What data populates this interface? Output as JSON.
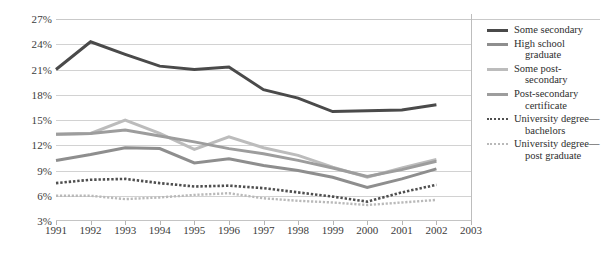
{
  "axes": {
    "y_ticks": [
      "27%",
      "24%",
      "21%",
      "18%",
      "15%",
      "12%",
      "9%",
      "6%",
      "3%"
    ],
    "x_ticks": [
      "1991",
      "1992",
      "1993",
      "1994",
      "1995",
      "1996",
      "1997",
      "1998",
      "1999",
      "2000",
      "2001",
      "2002",
      "2003"
    ]
  },
  "legend": {
    "items": [
      {
        "label_line1": "Some secondary",
        "label_line2": "",
        "color": "#4a4a4a",
        "style": "solid",
        "width": 3.0
      },
      {
        "label_line1": "High school",
        "label_line2": "graduate",
        "color": "#8e8e8e",
        "style": "solid",
        "width": 3.0
      },
      {
        "label_line1": "Some post-",
        "label_line2": "secondary",
        "color": "#bcbcbc",
        "style": "solid",
        "width": 3.0
      },
      {
        "label_line1": "Post-secondary",
        "label_line2": "certificate",
        "color": "#9d9d9d",
        "style": "solid",
        "width": 3.0
      },
      {
        "label_line1": "University degree—",
        "label_line2": "bachelors",
        "color": "#4f4f4f",
        "style": "dotted",
        "width": 2.6
      },
      {
        "label_line1": "University degree—",
        "label_line2": "post graduate",
        "color": "#b9b9b9",
        "style": "dotted",
        "width": 2.4
      }
    ]
  },
  "chart_data": {
    "type": "line",
    "title": "",
    "xlabel": "",
    "ylabel": "",
    "x": [
      "1991",
      "1992",
      "1993",
      "1994",
      "1995",
      "1996",
      "1997",
      "1998",
      "1999",
      "2000",
      "2001",
      "2002"
    ],
    "xlim": [
      "1991",
      "2003"
    ],
    "ylim": [
      3,
      27
    ],
    "ytick_step": 3,
    "grid": true,
    "legend_position": "right",
    "series": [
      {
        "name": "Some secondary",
        "color": "#4a4a4a",
        "style": "solid",
        "width": 3.0,
        "values": [
          21.0,
          24.3,
          22.8,
          21.4,
          21.0,
          21.3,
          18.6,
          17.6,
          16.0,
          16.1,
          16.2,
          16.8
        ]
      },
      {
        "name": "High school graduate",
        "color": "#8e8e8e",
        "style": "solid",
        "width": 3.0,
        "values": [
          10.2,
          10.9,
          11.7,
          11.6,
          9.9,
          10.4,
          9.6,
          9.0,
          8.2,
          7.0,
          8.0,
          9.2
        ]
      },
      {
        "name": "Some post-secondary",
        "color": "#bcbcbc",
        "style": "solid",
        "width": 3.0,
        "values": [
          13.3,
          13.4,
          15.0,
          13.4,
          11.5,
          13.0,
          11.7,
          10.8,
          9.4,
          8.2,
          9.3,
          10.3
        ]
      },
      {
        "name": "Post-secondary certificate",
        "color": "#9d9d9d",
        "style": "solid",
        "width": 3.0,
        "values": [
          13.3,
          13.4,
          13.8,
          13.1,
          12.4,
          11.6,
          11.0,
          10.2,
          9.3,
          8.3,
          9.1,
          10.1
        ]
      },
      {
        "name": "University degree—bachelors",
        "color": "#4f4f4f",
        "style": "dotted",
        "width": 2.6,
        "values": [
          7.5,
          7.9,
          8.0,
          7.5,
          7.1,
          7.2,
          6.9,
          6.4,
          5.9,
          5.3,
          6.4,
          7.3
        ]
      },
      {
        "name": "University degree—post graduate",
        "color": "#b9b9b9",
        "style": "dotted",
        "width": 2.4,
        "values": [
          6.0,
          6.0,
          5.6,
          5.8,
          6.1,
          6.3,
          5.7,
          5.4,
          5.2,
          4.9,
          5.2,
          5.5
        ]
      }
    ]
  }
}
